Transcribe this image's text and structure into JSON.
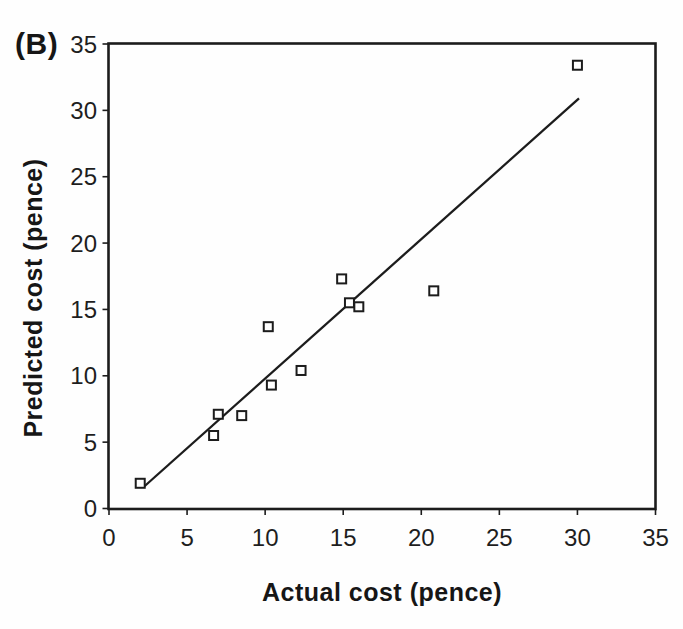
{
  "figure": {
    "panel_label": "(B)",
    "background": "#fefefe",
    "ink_color": "#1c1c1c"
  },
  "chart_data": {
    "type": "scatter",
    "title": "",
    "xlabel": "Actual cost (pence)",
    "ylabel": "Predicted cost (pence)",
    "xlim": [
      0,
      35
    ],
    "ylim": [
      0,
      35
    ],
    "xticks": [
      0,
      5,
      10,
      15,
      20,
      25,
      30,
      35
    ],
    "yticks": [
      0,
      5,
      10,
      15,
      20,
      25,
      30,
      35
    ],
    "grid": false,
    "legend": "none",
    "marker": {
      "shape": "open-square",
      "size": 9,
      "fill": "#ffffff",
      "stroke": "#1c1c1c"
    },
    "points": [
      {
        "x": 2,
        "y": 1.9
      },
      {
        "x": 6.7,
        "y": 5.5
      },
      {
        "x": 7,
        "y": 7.1
      },
      {
        "x": 8.5,
        "y": 7
      },
      {
        "x": 10.2,
        "y": 13.7
      },
      {
        "x": 10.4,
        "y": 9.3
      },
      {
        "x": 12.3,
        "y": 10.4
      },
      {
        "x": 14.9,
        "y": 17.3
      },
      {
        "x": 15.4,
        "y": 15.5
      },
      {
        "x": 16,
        "y": 15.2
      },
      {
        "x": 20.8,
        "y": 16.4
      },
      {
        "x": 30,
        "y": 33.4
      }
    ],
    "trendline": {
      "type": "linear",
      "x_start": 2.2,
      "y_start": 1.6,
      "x_end": 30.1,
      "y_end": 30.9
    }
  }
}
